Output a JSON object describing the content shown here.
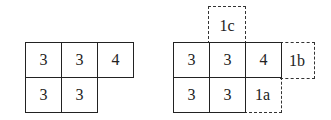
{
  "left_grid": {
    "cells": [
      {
        "row": 0,
        "col": 0,
        "value": "3"
      },
      {
        "row": 0,
        "col": 1,
        "value": "3"
      },
      {
        "row": 0,
        "col": 2,
        "value": "4"
      },
      {
        "row": 1,
        "col": 0,
        "value": "3"
      },
      {
        "row": 1,
        "col": 1,
        "value": "3"
      }
    ]
  },
  "right_grid": {
    "cells": [
      {
        "row": 0,
        "col": 0,
        "value": "3"
      },
      {
        "row": 0,
        "col": 1,
        "value": "3"
      },
      {
        "row": 0,
        "col": 2,
        "value": "4"
      },
      {
        "row": 1,
        "col": 0,
        "value": "3"
      },
      {
        "row": 1,
        "col": 1,
        "value": "3"
      }
    ],
    "dashed": [
      {
        "label": "1c",
        "position": "above col 1"
      },
      {
        "label": "1b",
        "position": "right of row 0"
      },
      {
        "label": "1a",
        "position": "row 1 col 2"
      }
    ]
  }
}
